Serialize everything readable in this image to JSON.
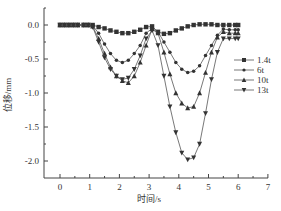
{
  "chart_data": {
    "type": "line",
    "title": "",
    "xlabel": "时间/s",
    "ylabel": "位移/mm",
    "xlim": [
      -0.5,
      7
    ],
    "ylim": [
      -2.25,
      0.25
    ],
    "x_ticks": [
      0,
      1,
      2,
      3,
      4,
      5,
      6,
      7
    ],
    "y_ticks": [
      0.0,
      -0.5,
      -1.0,
      -1.5,
      -2.0
    ],
    "x_tick_labels": [
      "0",
      "1",
      "2",
      "3",
      "4",
      "5",
      "6",
      "7"
    ],
    "y_tick_labels": [
      "0.0",
      "-0.5",
      "-1.0",
      "-1.5",
      "-2.0"
    ],
    "grid": false,
    "legend_position": "right-middle",
    "series": [
      {
        "name": "1.4t",
        "marker": "square",
        "x": [
          0,
          0.15,
          0.3,
          0.45,
          0.6,
          0.8,
          0.95,
          1.1,
          1.3,
          1.5,
          1.7,
          1.9,
          2.1,
          2.3,
          2.5,
          2.7,
          2.9,
          3.1,
          3.3,
          3.5,
          3.7,
          3.9,
          4.1,
          4.3,
          4.5,
          4.7,
          4.9,
          5.1,
          5.3,
          5.5,
          5.7,
          5.9,
          6.0
        ],
        "values": [
          0,
          0,
          0,
          0,
          0,
          0,
          0,
          0,
          -0.03,
          -0.05,
          -0.08,
          -0.1,
          -0.12,
          -0.12,
          -0.1,
          -0.07,
          -0.03,
          -0.02,
          -0.1,
          -0.13,
          -0.12,
          -0.08,
          -0.05,
          -0.02,
          0.0,
          0.01,
          0.01,
          0.01,
          0.0,
          0.0,
          0.0,
          0.0,
          0.0
        ]
      },
      {
        "name": "6t",
        "marker": "circle",
        "x": [
          0,
          0.15,
          0.3,
          0.45,
          0.6,
          0.8,
          0.95,
          1.1,
          1.3,
          1.5,
          1.7,
          1.9,
          2.1,
          2.3,
          2.5,
          2.7,
          2.9,
          3.1,
          3.3,
          3.5,
          3.7,
          3.9,
          4.1,
          4.3,
          4.5,
          4.7,
          4.9,
          5.1,
          5.3,
          5.5,
          5.7,
          5.9,
          6.0
        ],
        "values": [
          0,
          0,
          0,
          0,
          0,
          0,
          0,
          -0.01,
          -0.12,
          -0.28,
          -0.42,
          -0.52,
          -0.55,
          -0.52,
          -0.42,
          -0.3,
          -0.12,
          -0.05,
          -0.1,
          -0.25,
          -0.4,
          -0.55,
          -0.65,
          -0.7,
          -0.68,
          -0.6,
          -0.45,
          -0.3,
          -0.15,
          -0.06,
          -0.07,
          -0.07,
          -0.07
        ]
      },
      {
        "name": "10t",
        "marker": "triangle-up",
        "x": [
          0,
          0.15,
          0.3,
          0.45,
          0.6,
          0.8,
          0.95,
          1.1,
          1.3,
          1.5,
          1.7,
          1.9,
          2.1,
          2.3,
          2.5,
          2.7,
          2.9,
          3.1,
          3.3,
          3.5,
          3.7,
          3.9,
          4.1,
          4.3,
          4.5,
          4.7,
          4.9,
          5.1,
          5.3,
          5.5,
          5.7,
          5.9,
          6.0
        ],
        "values": [
          0,
          0,
          0,
          0,
          0,
          0,
          0,
          -0.02,
          -0.2,
          -0.42,
          -0.62,
          -0.75,
          -0.82,
          -0.85,
          -0.75,
          -0.55,
          -0.3,
          -0.06,
          -0.12,
          -0.4,
          -0.72,
          -1.0,
          -1.15,
          -1.22,
          -1.2,
          -1.0,
          -0.7,
          -0.4,
          -0.18,
          -0.1,
          -0.12,
          -0.12,
          -0.12
        ]
      },
      {
        "name": "13t",
        "marker": "triangle-down",
        "x": [
          0,
          0.15,
          0.3,
          0.45,
          0.6,
          0.8,
          0.95,
          1.1,
          1.3,
          1.5,
          1.7,
          1.9,
          2.1,
          2.3,
          2.5,
          2.7,
          2.9,
          3.1,
          3.3,
          3.5,
          3.7,
          3.9,
          4.1,
          4.3,
          4.5,
          4.7,
          4.9,
          5.1,
          5.3,
          5.5,
          5.7,
          5.9,
          6.0
        ],
        "values": [
          0,
          0,
          0,
          0,
          0,
          0,
          0,
          -0.03,
          -0.25,
          -0.48,
          -0.65,
          -0.75,
          -0.8,
          -0.78,
          -0.65,
          -0.45,
          -0.2,
          -0.08,
          -0.3,
          -0.75,
          -1.2,
          -1.58,
          -1.88,
          -1.98,
          -1.95,
          -1.75,
          -1.3,
          -0.8,
          -0.4,
          -0.2,
          -0.2,
          -0.2,
          -0.2
        ]
      }
    ]
  },
  "legend": {
    "items": [
      {
        "label": "1.4t",
        "marker": "square"
      },
      {
        "label": "6t",
        "marker": "circle"
      },
      {
        "label": "10t",
        "marker": "triangle-up"
      },
      {
        "label": "13t",
        "marker": "triangle-down"
      }
    ]
  },
  "axes": {
    "xlabel": "时间/s",
    "ylabel": "位移/mm"
  },
  "colors": {
    "line": "#555555",
    "marker": "#333333",
    "axis": "#444444"
  }
}
